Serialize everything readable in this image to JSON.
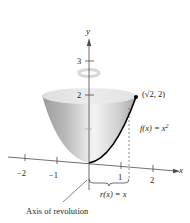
{
  "figure": {
    "type": "paraboloid-of-revolution",
    "axes": {
      "x_label": "x",
      "y_label": "y",
      "x_ticks": [
        "−2",
        "−1",
        "1",
        "2"
      ],
      "y_ticks": [
        "2",
        "3"
      ]
    },
    "point_label": "(√2, 2)",
    "function_label": {
      "prefix": "f(x) = x",
      "exponent": "2"
    },
    "radius_label": "r(x) = x",
    "axis_caption": "Axis of revolution",
    "colors": {
      "surface_light": "#f2f2f2",
      "surface_mid": "#cfcfcf",
      "surface_dark": "#9d9d9d",
      "curve": "#000000",
      "axes": "#4a4a4a",
      "rotation_arrow": "#d9d9d9"
    }
  }
}
